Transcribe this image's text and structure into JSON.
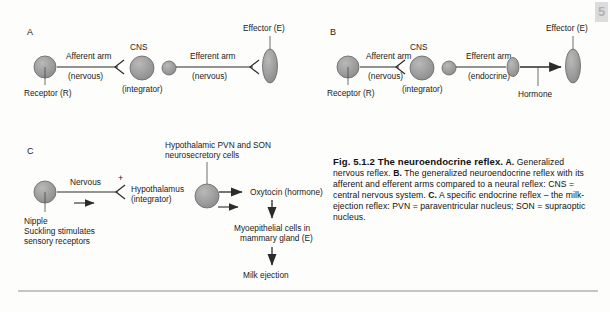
{
  "figure": {
    "page_tab": "5",
    "panels": {
      "A": {
        "letter": "A",
        "receptor_label": "Receptor (R)",
        "afferent_label": "Afferent arm",
        "afferent_sub": "(nervous)",
        "cns_label": "CNS",
        "cns_sub": "(integrator)",
        "efferent_label": "Efferent arm",
        "efferent_sub": "(nervous)",
        "effector_label": "Effector (E)"
      },
      "B": {
        "letter": "B",
        "receptor_label": "Receptor (R)",
        "afferent_label": "Afferent arm",
        "afferent_sub": "(nervous)",
        "cns_label": "CNS",
        "cns_sub": "(integrator)",
        "efferent_label": "Efferent arm",
        "efferent_sub": "(endocrine)",
        "hormone_label": "Hormone",
        "effector_label": "Effector (E)"
      },
      "C": {
        "letter": "C",
        "nipple_label": "Nipple",
        "nipple_sub1": "Suckling stimulates",
        "nipple_sub2": "sensory receptors",
        "nervous_label": "Nervous",
        "plus_sign": "+",
        "hypothalamus_label": "Hypothalamus",
        "hypothalamus_sub": "(integrator)",
        "pvn_line1": "Hypothalamic PVN and SON",
        "pvn_line2": "neurosecretory cells",
        "oxytocin_label": "Oxytocin (hormone)",
        "myo_line1": "Myoepithelial cells in",
        "myo_line2": "mammary gland (E)",
        "milk_label": "Milk ejection"
      }
    },
    "caption": {
      "title": "Fig. 5.1.2",
      "title_rest": "The neuroendocrine reflex.",
      "a_marker": "A.",
      "a_text": "Generalized nervous reflex.",
      "b_marker": "B.",
      "b_text": "The generalized neuroendocrine reflex with its afferent and efferent arms compared to a neural reflex: CNS = central nervous system.",
      "c_marker": "C.",
      "c_text": "A specific endocrine reflex – the milk-ejection reflex: PVN = paraventricular nucleus; SON = supraoptic nucleus."
    },
    "colors": {
      "cell_fill": "#9a9a9a",
      "cell_stroke": "#6a6a6a",
      "line": "#2b2b2b",
      "background": "#fdfdfc",
      "rule": "#8e8e8e"
    }
  }
}
